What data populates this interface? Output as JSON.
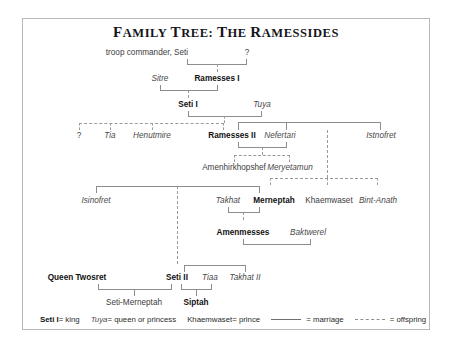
{
  "title": "Family Tree: The Ramessides",
  "nodes": {
    "troop_commander": "troop commander, Seti",
    "unknown_1": "?",
    "sitre": "Sitre",
    "ramesses_i": "Ramesses I",
    "seti_i": "Seti I",
    "tuya": "Tuya",
    "unknown_2": "?",
    "tia": "Tia",
    "henutmire": "Henutmire",
    "ramesses_ii": "Ramesses II",
    "nefertari": "Nefertari",
    "istnofret": "Istnofret",
    "amenhirkhopshef": "Amenhirkhopshef",
    "meryetamun": "Meryetamun",
    "isinofret": "Isinofret",
    "takhat": "Takhat",
    "merneptah": "Merneptah",
    "khaemwaset": "Khaemwaset",
    "bint_anath": "Bint-Anath",
    "amenmesses": "Amenmesses",
    "baktwerel": "Baktwerel",
    "queen_twosret": "Queen Twosret",
    "seti_ii": "Seti II",
    "tiaa": "Tiaa",
    "takhat_ii": "Takhat II",
    "seti_merneptah": "Seti-Merneptah",
    "siptah": "Siptah"
  },
  "legend": {
    "king_name": "Seti I",
    "king_eq": " = king",
    "queen_name": "Tuya",
    "queen_eq": " = queen or princess",
    "prince_name": "Khaemwaset",
    "prince_eq": " = prince",
    "marriage_label": "= marriage",
    "offspring_label": "= offspring"
  },
  "colors": {
    "frame": "#b9b9b9",
    "line": "#8d8d8d",
    "text": "#2b2b2b",
    "king_text": "#111111"
  }
}
